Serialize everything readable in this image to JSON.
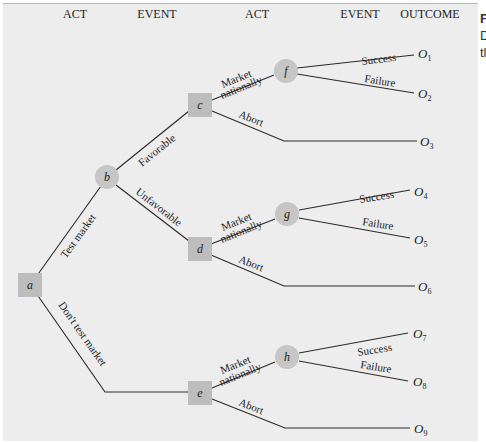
{
  "headers": {
    "col1": "ACT",
    "col2": "EVENT",
    "col3": "ACT",
    "col4": "EVENT",
    "col5": "OUTCOME"
  },
  "nodes": {
    "a": {
      "id": "a",
      "type": "decision"
    },
    "b": {
      "id": "b",
      "type": "chance"
    },
    "c": {
      "id": "c",
      "type": "decision"
    },
    "d": {
      "id": "d",
      "type": "decision"
    },
    "e": {
      "id": "e",
      "type": "decision"
    },
    "f": {
      "id": "f",
      "type": "chance"
    },
    "g": {
      "id": "g",
      "type": "chance"
    },
    "h": {
      "id": "h",
      "type": "chance"
    }
  },
  "edges": {
    "a_b": "Test market",
    "a_e": "Don't test market",
    "b_c": "Favorable",
    "b_d": "Unfavorable",
    "c_f_line1": "Market",
    "c_f_line2": "nationally",
    "c_abort": "Abort",
    "d_g_line1": "Market",
    "d_g_line2": "nationally",
    "d_abort": "Abort",
    "e_h_line1": "Market",
    "e_h_line2": "nationally",
    "e_abort": "Abort",
    "f_success": "Success",
    "f_failure": "Failure",
    "g_success": "Success",
    "g_failure": "Failure",
    "h_success": "Success",
    "h_failure": "Failure"
  },
  "outcomes": {
    "o1": {
      "base": "O",
      "sub": "1"
    },
    "o2": {
      "base": "O",
      "sub": "2"
    },
    "o3": {
      "base": "O",
      "sub": "3"
    },
    "o4": {
      "base": "O",
      "sub": "4"
    },
    "o5": {
      "base": "O",
      "sub": "5"
    },
    "o6": {
      "base": "O",
      "sub": "6"
    },
    "o7": {
      "base": "O",
      "sub": "7"
    },
    "o8": {
      "base": "O",
      "sub": "8"
    },
    "o9": {
      "base": "O",
      "sub": "9"
    }
  },
  "side_text": {
    "line1": "F",
    "line2": "D",
    "line3": "tl"
  },
  "colors": {
    "panel": "#ededed",
    "decision_node": "#bdbdbd",
    "chance_node": "#c6c6c6",
    "line": "#2a2a2a"
  }
}
